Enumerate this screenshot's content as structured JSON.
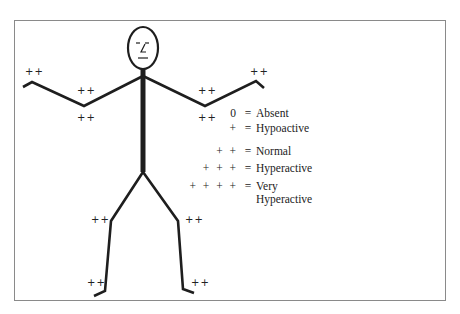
{
  "figure": {
    "colors": {
      "line": "#1e1e1e",
      "frame": "#8a8a8a",
      "text": "#222222"
    },
    "reflex_labels": [
      {
        "site": "left-hand-upper",
        "value": "++"
      },
      {
        "site": "left-elbow-upper",
        "value": "++"
      },
      {
        "site": "left-elbow-lower",
        "value": "++"
      },
      {
        "site": "right-elbow-upper",
        "value": "++"
      },
      {
        "site": "right-elbow-lower",
        "value": "++"
      },
      {
        "site": "right-hand-upper",
        "value": "++"
      },
      {
        "site": "left-knee",
        "value": "++"
      },
      {
        "site": "right-knee",
        "value": "++"
      },
      {
        "site": "left-ankle",
        "value": "++"
      },
      {
        "site": "right-ankle",
        "value": "++"
      }
    ]
  },
  "legend": {
    "items": [
      {
        "symbol": "0",
        "equals": "=",
        "label": "Absent"
      },
      {
        "symbol": "+",
        "equals": "=",
        "label": "Hypoactive"
      },
      {
        "symbol": "+ +",
        "equals": "=",
        "label": "Normal"
      },
      {
        "symbol": "+ + +",
        "equals": "=",
        "label": "Hyperactive"
      },
      {
        "symbol": "+ + + +",
        "equals": "=",
        "label": "Very",
        "label_line2": "Hyperactive"
      }
    ]
  }
}
